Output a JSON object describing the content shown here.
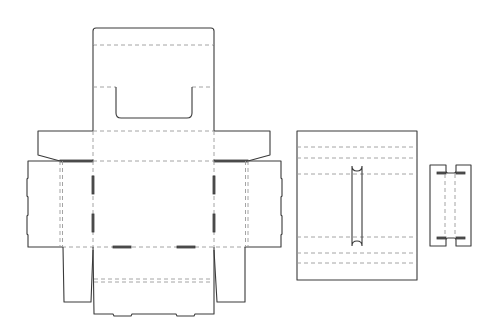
{
  "diagram": {
    "type": "packaging-dieline",
    "colors": {
      "background": "#ffffff",
      "cut_line": "#3a3a3a",
      "crease_line": "#9a9a9a",
      "tab_fill": "#555555"
    },
    "pieces": [
      {
        "id": "main-box",
        "label": "Main box blank with handle cutout"
      },
      {
        "id": "divider-panel",
        "label": "Divider panel with slot"
      },
      {
        "id": "insert-strip",
        "label": "Insert strip with notches"
      }
    ],
    "text_labels": []
  }
}
